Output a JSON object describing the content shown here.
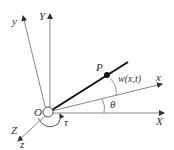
{
  "diagram": {
    "labels": {
      "Y_axis": "Y",
      "y_axis": "y",
      "X_axis": "X",
      "x_axis": "x",
      "Z_axis": "Z",
      "z_axis": "z",
      "origin": "O",
      "point": "P",
      "deflection": "w(x,t)",
      "angle_theta": "θ",
      "angle_tau": "τ"
    },
    "colors": {
      "axis": "#888888",
      "beam": "#111111",
      "text": "#333333"
    }
  }
}
